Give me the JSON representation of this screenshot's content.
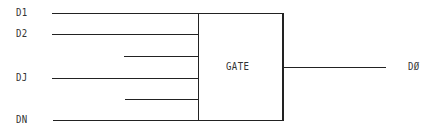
{
  "diagram": {
    "type": "logic-gate-block",
    "gate": {
      "label": "GATE",
      "x": 198,
      "y": 13,
      "width": 85,
      "height": 107
    },
    "inputs": [
      {
        "label": "D1",
        "y": 13,
        "x_start": 52
      },
      {
        "label": "D2",
        "y": 34,
        "x_start": 52
      },
      {
        "label": "",
        "y": 56,
        "x_start": 124
      },
      {
        "label": "DJ",
        "y": 78,
        "x_start": 52
      },
      {
        "label": "",
        "y": 99,
        "x_start": 125
      },
      {
        "label": "DN",
        "y": 120,
        "x_start": 53
      }
    ],
    "output": {
      "label": "DØ",
      "y": 67,
      "x_start": 283,
      "x_end": 386
    },
    "stroke_color": "#222222",
    "text_color": "#333333"
  }
}
